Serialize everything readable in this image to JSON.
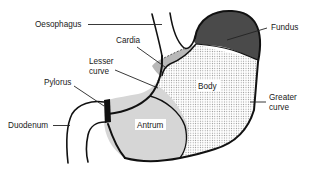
{
  "diagram": {
    "labels": {
      "oesophagus": "Oesophagus",
      "cardia": "Cardia",
      "lesser_curve_line1": "Lesser",
      "lesser_curve_line2": "curve",
      "pylorus": "Pylorus",
      "duodenum": "Duodenum",
      "fundus": "Fundus",
      "body": "Body",
      "antrum": "Antrum",
      "greater_curve_line1": "Greater",
      "greater_curve_line2": "curve"
    },
    "colors": {
      "fundus": "#4a4a4a",
      "cardia": "#b8b8b8",
      "body_dots": "#8a8a8a",
      "antrum": "#d6d6d6",
      "pylorus": "#111111",
      "outline": "#111111",
      "background": "#ffffff"
    }
  }
}
